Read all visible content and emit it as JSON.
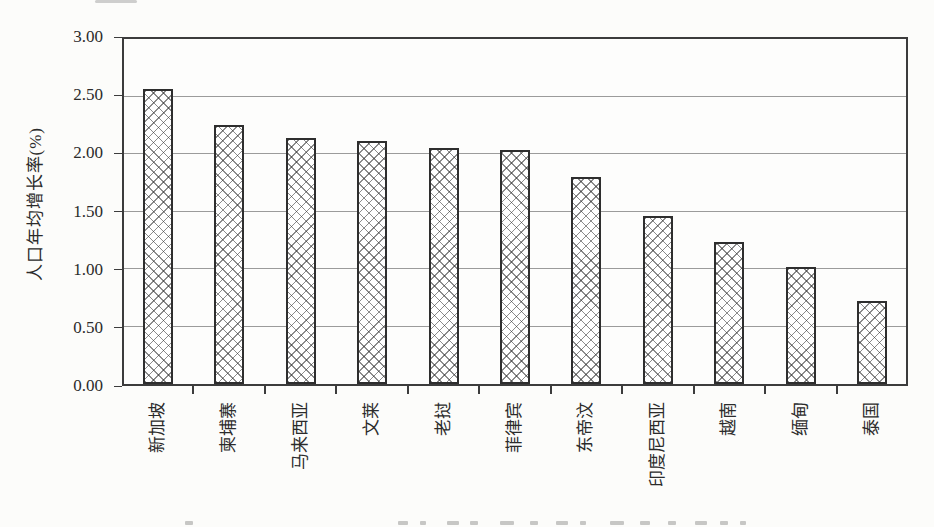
{
  "figure": {
    "background_color": "#fcfcfa",
    "frame_color": "#3c3c3c",
    "gridline_color": "#9b9b9b",
    "bar_border_color": "#2e2e2e",
    "bar_fill_pattern": "diagonal-crosshatch",
    "text_color": "#2b2b2b"
  },
  "chart_data": {
    "type": "bar",
    "title": "",
    "xlabel": "",
    "ylabel": "人口年均增长率(%)",
    "categories": [
      "新加坡",
      "柬埔寨",
      "马来西亚",
      "文莱",
      "老挝",
      "菲律宾",
      "东帝汶",
      "印度尼西亚",
      "越南",
      "缅甸",
      "泰国"
    ],
    "values": [
      2.55,
      2.24,
      2.13,
      2.1,
      2.04,
      2.02,
      1.79,
      1.45,
      1.23,
      1.01,
      0.72
    ],
    "ylim": [
      0,
      3
    ],
    "ytick_step": 0.5,
    "ytick_labels": [
      "0.00",
      "0.50",
      "1.00",
      "1.50",
      "2.00",
      "2.50",
      "3.00"
    ],
    "grid": true,
    "legend": "none",
    "x_tick_label_rotation": 90,
    "bar_fill": "white with gray diagonal crosshatch",
    "series_count": 1
  }
}
